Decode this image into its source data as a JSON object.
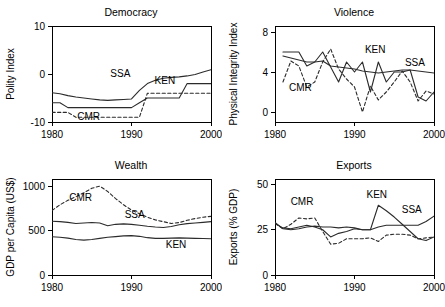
{
  "figure": {
    "background": "#ffffff",
    "line_color": "#2b2b2b",
    "axis_color": "#000000"
  },
  "chart_data": [
    {
      "type": "line",
      "title": "Democracy",
      "xlabel": "",
      "ylabel": "Polity Index",
      "xlim": [
        1980,
        2000
      ],
      "ylim": [
        -10,
        10
      ],
      "xticks": [
        1980,
        1990,
        2000
      ],
      "xtick_labels": [
        "1980",
        "1990",
        "2000"
      ],
      "yticks": [
        -10,
        0,
        10
      ],
      "ytick_labels": [
        "-10",
        "0",
        "10"
      ],
      "grid": false,
      "legend": "inline-annotations",
      "annotations": [
        {
          "text": "SSA",
          "x": 1988.6,
          "y": -0.6
        },
        {
          "text": "KEN",
          "x": 1994.2,
          "y": -2.0
        },
        {
          "text": "CMR",
          "x": 1984.6,
          "y": -9.5
        }
      ],
      "series": [
        {
          "name": "SSA",
          "style": "solid",
          "x": [
            1980,
            1981,
            1982,
            1983,
            1984,
            1985,
            1986,
            1987,
            1988,
            1989,
            1990,
            1991,
            1992,
            1993,
            1994,
            1995,
            1996,
            1997,
            1998,
            1999,
            2000
          ],
          "values": [
            -3.9,
            -4.1,
            -4.5,
            -4.8,
            -5.0,
            -5.2,
            -5.4,
            -5.5,
            -5.4,
            -5.3,
            -5.2,
            -3.4,
            -2.0,
            -1.3,
            -0.9,
            -0.7,
            -0.6,
            -0.4,
            -0.1,
            0.4,
            0.9
          ]
        },
        {
          "name": "KEN",
          "style": "solid",
          "x": [
            1980,
            1981,
            1982,
            1983,
            1984,
            1985,
            1986,
            1987,
            1988,
            1989,
            1990,
            1991,
            1992,
            1993,
            1994,
            1995,
            1996,
            1997,
            1998,
            1999,
            2000
          ],
          "values": [
            -6.0,
            -6.0,
            -7.0,
            -7.0,
            -7.0,
            -7.0,
            -7.0,
            -7.0,
            -7.0,
            -7.0,
            -7.0,
            -6.0,
            -5.0,
            -5.0,
            -5.0,
            -5.0,
            -5.0,
            -2.0,
            -2.0,
            -2.0,
            -2.0
          ]
        },
        {
          "name": "CMR",
          "style": "dashed",
          "x": [
            1980,
            1981,
            1982,
            1983,
            1984,
            1985,
            1986,
            1987,
            1988,
            1989,
            1990,
            1991,
            1992,
            1993,
            1994,
            1995,
            1996,
            1997,
            1998,
            1999,
            2000
          ],
          "values": [
            -8.0,
            -8.0,
            -8.0,
            -9.0,
            -9.0,
            -9.0,
            -9.0,
            -9.0,
            -9.0,
            -9.0,
            -9.0,
            -9.0,
            -4.0,
            -4.0,
            -4.0,
            -4.0,
            -4.0,
            -4.0,
            -4.0,
            -4.0,
            -4.0
          ]
        }
      ]
    },
    {
      "type": "line",
      "title": "Violence",
      "xlabel": "",
      "ylabel": "Physical Integrity Index",
      "xlim": [
        1980,
        2000
      ],
      "ylim": [
        -1,
        8.6
      ],
      "xticks": [
        1980,
        1990,
        2000
      ],
      "xtick_labels": [
        "1980",
        "1990",
        "2000"
      ],
      "yticks": [
        0,
        4,
        8
      ],
      "ytick_labels": [
        "0",
        "4",
        "8"
      ],
      "grid": false,
      "legend": "inline-annotations",
      "annotations": [
        {
          "text": "CMR",
          "x": 1983.2,
          "y": 2.1
        },
        {
          "text": "KEN",
          "x": 1992.6,
          "y": 5.9
        },
        {
          "text": "SSA",
          "x": 1997.6,
          "y": 4.6
        }
      ],
      "series": [
        {
          "name": "SSA",
          "style": "solid",
          "x": [
            1981,
            1982,
            1983,
            1984,
            1985,
            1986,
            1987,
            1988,
            1989,
            1990,
            1991,
            1992,
            1993,
            1994,
            1995,
            1996,
            1997,
            1998,
            1999,
            2000
          ],
          "values": [
            5.6,
            5.4,
            5.2,
            5.0,
            5.0,
            5.1,
            4.6,
            4.5,
            4.4,
            4.3,
            4.1,
            4.0,
            3.9,
            4.0,
            4.1,
            4.2,
            4.2,
            4.1,
            4.0,
            3.9
          ]
        },
        {
          "name": "KEN",
          "style": "solid",
          "x": [
            1981,
            1982,
            1983,
            1984,
            1985,
            1986,
            1987,
            1988,
            1989,
            1990,
            1991,
            1992,
            1993,
            1994,
            1995,
            1996,
            1997,
            1998,
            1999,
            2000
          ],
          "values": [
            6.0,
            6.0,
            6.0,
            4.6,
            5.0,
            6.0,
            4.5,
            3.0,
            5.0,
            4.0,
            5.0,
            2.0,
            5.0,
            3.0,
            4.0,
            4.0,
            4.2,
            1.5,
            1.1,
            2.0
          ]
        },
        {
          "name": "CMR",
          "style": "dashed",
          "x": [
            1981,
            1982,
            1983,
            1984,
            1985,
            1986,
            1987,
            1988,
            1989,
            1990,
            1991,
            1992,
            1993,
            1994,
            1995,
            1996,
            1997,
            1998,
            1999,
            2000
          ],
          "values": [
            3.0,
            5.1,
            4.6,
            2.5,
            3.0,
            5.0,
            6.3,
            4.3,
            3.3,
            2.5,
            0.0,
            2.6,
            1.2,
            2.0,
            3.0,
            4.1,
            3.0,
            1.1,
            2.1,
            1.8
          ]
        }
      ]
    },
    {
      "type": "line",
      "title": "Wealth",
      "xlabel": "",
      "ylabel": "GDP per Capita (US$)",
      "xlim": [
        1980,
        2000
      ],
      "ylim": [
        0,
        1080
      ],
      "xticks": [
        1980,
        1990,
        2000
      ],
      "xtick_labels": [
        "1980",
        "1990",
        "2000"
      ],
      "yticks": [
        0,
        500,
        1000
      ],
      "ytick_labels": [
        "0",
        "500",
        "1000"
      ],
      "grid": false,
      "legend": "inline-annotations",
      "annotations": [
        {
          "text": "CMR",
          "x": 1983.6,
          "y": 835
        },
        {
          "text": "SSA",
          "x": 1990.4,
          "y": 640
        },
        {
          "text": "KEN",
          "x": 1995.6,
          "y": 300
        }
      ],
      "series": [
        {
          "name": "CMR",
          "style": "dashed",
          "x": [
            1980,
            1981,
            1982,
            1983,
            1984,
            1985,
            1986,
            1987,
            1988,
            1989,
            1990,
            1991,
            1992,
            1993,
            1994,
            1995,
            1996,
            1997,
            1998,
            1999,
            2000
          ],
          "values": [
            725,
            790,
            840,
            880,
            925,
            975,
            1000,
            940,
            860,
            790,
            730,
            690,
            650,
            620,
            600,
            580,
            590,
            615,
            635,
            650,
            660
          ]
        },
        {
          "name": "SSA",
          "style": "solid",
          "x": [
            1980,
            1981,
            1982,
            1983,
            1984,
            1985,
            1986,
            1987,
            1988,
            1989,
            1990,
            1991,
            1992,
            1993,
            1994,
            1995,
            1996,
            1997,
            1998,
            1999,
            2000
          ],
          "values": [
            605,
            600,
            592,
            580,
            585,
            590,
            585,
            555,
            570,
            575,
            570,
            560,
            548,
            540,
            535,
            545,
            565,
            578,
            585,
            592,
            600
          ]
        },
        {
          "name": "KEN",
          "style": "solid",
          "x": [
            1980,
            1981,
            1982,
            1983,
            1984,
            1985,
            1986,
            1987,
            1988,
            1989,
            1990,
            1991,
            1992,
            1993,
            1994,
            1995,
            1996,
            1997,
            1998,
            1999,
            2000
          ],
          "values": [
            430,
            425,
            415,
            400,
            392,
            400,
            412,
            425,
            432,
            440,
            443,
            435,
            420,
            412,
            412,
            415,
            418,
            415,
            412,
            410,
            408
          ]
        }
      ]
    },
    {
      "type": "line",
      "title": "Exports",
      "xlabel": "",
      "ylabel": "Exports (% GDP)",
      "xlim": [
        1980,
        2000
      ],
      "ylim": [
        0,
        53
      ],
      "xticks": [
        1980,
        1990,
        2000
      ],
      "xtick_labels": [
        "1980",
        "1990",
        "2000"
      ],
      "yticks": [
        0,
        25,
        50
      ],
      "ytick_labels": [
        "0",
        "25",
        "50"
      ],
      "grid": false,
      "legend": "inline-annotations",
      "annotations": [
        {
          "text": "CMR",
          "x": 1983.4,
          "y": 38.5
        },
        {
          "text": "KEN",
          "x": 1992.8,
          "y": 42.5
        },
        {
          "text": "SSA",
          "x": 1997.2,
          "y": 34.5
        }
      ],
      "series": [
        {
          "name": "CMR",
          "style": "dashed",
          "x": [
            1980,
            1981,
            1982,
            1983,
            1984,
            1985,
            1986,
            1987,
            1988,
            1989,
            1990,
            1991,
            1992,
            1993,
            1994,
            1995,
            1996,
            1997,
            1998,
            1999,
            2000
          ],
          "values": [
            28.5,
            25.5,
            28.0,
            31.5,
            31.0,
            31.5,
            24.0,
            17.0,
            17.5,
            20.0,
            20.0,
            20.0,
            20.5,
            18.5,
            22.0,
            22.5,
            22.5,
            22.0,
            20.0,
            20.5,
            21.0
          ]
        },
        {
          "name": "SSA",
          "style": "solid",
          "x": [
            1980,
            1981,
            1982,
            1983,
            1984,
            1985,
            1986,
            1987,
            1988,
            1989,
            1990,
            1991,
            1992,
            1993,
            1994,
            1995,
            1996,
            1997,
            1998,
            1999,
            2000
          ],
          "values": [
            29.0,
            25.5,
            25.0,
            25.5,
            26.5,
            27.0,
            26.5,
            26.5,
            26.0,
            26.5,
            26.0,
            25.0,
            25.0,
            26.5,
            27.5,
            27.5,
            27.5,
            27.5,
            27.5,
            29.5,
            32.5
          ]
        },
        {
          "name": "KEN",
          "style": "solid",
          "x": [
            1980,
            1981,
            1982,
            1983,
            1984,
            1985,
            1986,
            1987,
            1988,
            1989,
            1990,
            1991,
            1992,
            1993,
            1994,
            1995,
            1996,
            1997,
            1998,
            1999,
            2000
          ],
          "values": [
            28.5,
            26.0,
            25.5,
            26.5,
            27.5,
            26.5,
            25.0,
            21.0,
            23.0,
            24.0,
            25.5,
            25.0,
            25.0,
            38.5,
            35.5,
            32.0,
            28.0,
            24.0,
            20.0,
            19.0,
            21.0
          ]
        }
      ]
    }
  ]
}
